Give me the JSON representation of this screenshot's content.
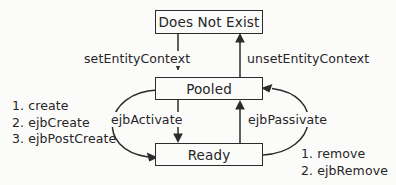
{
  "diagram": {
    "type": "state-diagram",
    "background_color": "#fbfbfa",
    "line_color": "#2b2b2b",
    "text_color": "#262626",
    "states": [
      {
        "id": "does-not-exist",
        "label": "Does Not Exist"
      },
      {
        "id": "pooled",
        "label": "Pooled"
      },
      {
        "id": "ready",
        "label": "Ready"
      }
    ],
    "transitions": [
      {
        "id": "set-entity-context",
        "label": "setEntityContext",
        "from": "does-not-exist",
        "to": "pooled",
        "shape": "straight-vertical"
      },
      {
        "id": "unset-entity-context",
        "label": "unsetEntityContext",
        "from": "pooled",
        "to": "does-not-exist",
        "shape": "straight-vertical"
      },
      {
        "id": "ejb-activate",
        "label": "ejbActivate",
        "from": "pooled",
        "to": "ready",
        "shape": "straight-vertical"
      },
      {
        "id": "ejb-passivate",
        "label": "ejbPassivate",
        "from": "ready",
        "to": "pooled",
        "shape": "straight-vertical"
      },
      {
        "id": "create-sequence",
        "label": "",
        "from": "pooled",
        "to": "ready",
        "shape": "curved-left-arc"
      },
      {
        "id": "remove-sequence",
        "label": "",
        "from": "ready",
        "to": "pooled",
        "shape": "curved-right-arc"
      }
    ],
    "create_sequence": {
      "id": "create-sequence-list",
      "steps": [
        "1. create",
        "2. ejbCreate",
        "3. ejbPostCreate"
      ]
    },
    "remove_sequence": {
      "id": "remove-sequence-list",
      "steps": [
        "1. remove",
        "2. ejbRemove"
      ]
    }
  }
}
